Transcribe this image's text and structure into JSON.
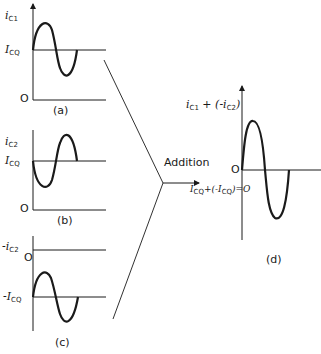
{
  "panels": {
    "a": {
      "caption": "(a)",
      "y_label_main": "i",
      "y_label_sub": "C1",
      "baseline_label_main": "I",
      "baseline_label_sub": "CQ",
      "origin_label": "O"
    },
    "b": {
      "caption": "(b)",
      "y_label_main": "i",
      "y_label_sub": "C2",
      "baseline_label_main": "I",
      "baseline_label_sub": "CQ",
      "origin_label": "O"
    },
    "c": {
      "caption": "(c)",
      "y_label_main": "-i",
      "y_label_sub": "C2",
      "baseline_label_main": "-I",
      "baseline_label_sub": "CQ",
      "origin_label": "O"
    },
    "d": {
      "caption": "(d)",
      "y_label": "i",
      "y_label_sub1": "C1",
      "y_label_mid": " + (-i",
      "y_label_sub2": "C2",
      "y_label_end": ")",
      "origin_label": "O",
      "baseline_text_a": "I",
      "baseline_sub_a": "CQ",
      "baseline_text_b": "+(-I",
      "baseline_sub_b": "CQ",
      "baseline_text_c": ")=O"
    }
  },
  "operation_label": "Addition",
  "colors": {
    "ink": "#1a1a1a",
    "background": "#ffffff"
  }
}
